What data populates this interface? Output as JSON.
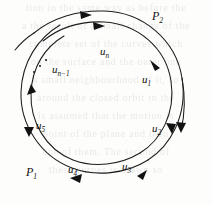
{
  "figure": {
    "background_color": "#fdfdfc",
    "ink_color": "#131313"
  },
  "curves": [
    {
      "name": "inner-spiral",
      "label": "P1",
      "label_text": "P",
      "label_sub": "1",
      "direction": "clockwise"
    },
    {
      "name": "outer-spiral",
      "label": "P2",
      "label_text": "P",
      "label_sub": "2",
      "direction": "clockwise"
    }
  ],
  "labels": {
    "p1": {
      "text": "P",
      "sub": "1",
      "x": 26,
      "y": 168
    },
    "p2": {
      "text": "P",
      "sub": "2",
      "x": 152,
      "y": 10
    },
    "u1": {
      "text": "u",
      "sub": "1",
      "x": 142,
      "y": 76
    },
    "u2": {
      "text": "u",
      "sub": "2",
      "x": 152,
      "y": 125
    },
    "u3": {
      "text": "u",
      "sub": "3",
      "x": 122,
      "y": 163
    },
    "u4": {
      "text": "u",
      "sub": "4",
      "x": 68,
      "y": 166
    },
    "u5": {
      "text": "u",
      "sub": "5",
      "x": 36,
      "y": 122
    },
    "un": {
      "text": "u",
      "sub": "n",
      "x": 100,
      "y": 48
    },
    "unm1": {
      "text": "u",
      "sub": "n−1",
      "x": 52,
      "y": 66
    }
  },
  "ellipsis": {
    "name": "ellipsis-dots",
    "count": 3
  },
  "arrowheads": [
    {
      "name": "arrowhead-outer-top",
      "direction": "right"
    },
    {
      "name": "arrowhead-inner-top",
      "direction": "right"
    },
    {
      "name": "arrowhead-u1",
      "direction": "down-right"
    },
    {
      "name": "arrowhead-u2",
      "direction": "down"
    },
    {
      "name": "arrowhead-u3",
      "direction": "down-left"
    },
    {
      "name": "arrowhead-u4",
      "direction": "left"
    },
    {
      "name": "arrowhead-u5",
      "direction": "down"
    },
    {
      "name": "arrowhead-outer-left",
      "direction": "up"
    },
    {
      "name": "arrowhead-outer-right-end",
      "direction": "down"
    }
  ],
  "ghost_text": {
    "lines": [
      "tion  in  the  same  way  as  before  the",
      "a  the  result  of  a  small  change  of  the",
      "complete  set  of  the  curves  which",
      "on  the  surface  and  the  outer  one",
      "a  small  neighbourhood  of  it,  so",
      "around  the  closed  orbit  in  the",
      "is  assumed  that  the  motion  is",
      "point  of  the  plane  and  then",
      "one  of  them.   The  second  of",
      "these  curves  is  drawn  so"
    ]
  }
}
